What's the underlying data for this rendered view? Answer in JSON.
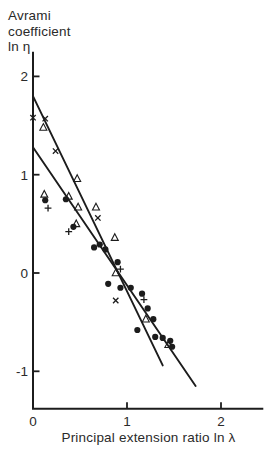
{
  "figure": {
    "background": "#ffffff",
    "ink_color": "#1c1c1c",
    "text_color": "#2a2a2a"
  },
  "chart_data": {
    "type": "scatter",
    "ylabel": "Avrami coefficient ln η",
    "ylabel_lines": [
      "Avrami",
      "coefficient",
      "ln η"
    ],
    "xlabel": "Principal extension ratio ln λ",
    "x_ticks": [
      0,
      1,
      2
    ],
    "y_ticks": [
      2,
      1,
      0,
      -1
    ],
    "xlim": [
      0,
      2.45
    ],
    "ylim": [
      -1.38,
      2.25
    ],
    "grid": false,
    "legend": "none",
    "series": [
      {
        "name": "filled-circle",
        "marker": "circle",
        "points": [
          [
            0.13,
            0.74
          ],
          [
            0.35,
            0.75
          ],
          [
            0.43,
            0.47
          ],
          [
            0.65,
            0.26
          ],
          [
            0.71,
            0.29
          ],
          [
            0.77,
            0.24
          ],
          [
            0.9,
            0.11
          ],
          [
            0.8,
            -0.11
          ],
          [
            0.93,
            -0.15
          ],
          [
            1.04,
            -0.15
          ],
          [
            1.16,
            -0.21
          ],
          [
            1.22,
            -0.36
          ],
          [
            1.28,
            -0.47
          ],
          [
            1.11,
            -0.58
          ],
          [
            1.3,
            -0.65
          ],
          [
            1.38,
            -0.66
          ],
          [
            1.46,
            -0.69
          ],
          [
            1.48,
            -0.75
          ]
        ]
      },
      {
        "name": "open-triangle",
        "marker": "triangle",
        "points": [
          [
            0.11,
            1.48
          ],
          [
            0.47,
            0.96
          ],
          [
            0.12,
            0.8
          ],
          [
            0.38,
            0.78
          ],
          [
            0.48,
            0.67
          ],
          [
            0.67,
            0.67
          ],
          [
            0.46,
            0.5
          ],
          [
            0.87,
            0.36
          ],
          [
            0.88,
            0.0
          ],
          [
            1.2,
            -0.47
          ],
          [
            1.44,
            -0.73
          ]
        ]
      },
      {
        "name": "x-mark",
        "marker": "x",
        "points": [
          [
            0.0,
            1.58
          ],
          [
            0.13,
            1.57
          ],
          [
            0.24,
            1.24
          ],
          [
            0.69,
            0.56
          ],
          [
            0.88,
            -0.28
          ]
        ]
      },
      {
        "name": "plus-mark",
        "marker": "plus",
        "points": [
          [
            0.16,
            0.66
          ],
          [
            0.38,
            0.42
          ],
          [
            0.93,
            0.04
          ],
          [
            1.18,
            -0.27
          ]
        ]
      }
    ],
    "fit_lines": [
      {
        "name": "steep-line",
        "x1": 0,
        "y1": 1.8,
        "x2": 1.38,
        "y2": -0.94
      },
      {
        "name": "shallow-line",
        "x1": 0,
        "y1": 1.28,
        "x2": 1.73,
        "y2": -1.15
      }
    ]
  }
}
